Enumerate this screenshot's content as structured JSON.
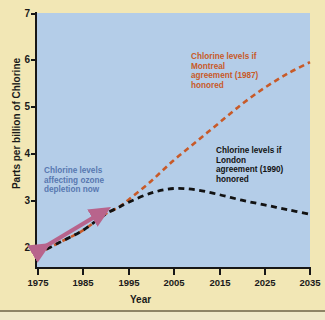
{
  "figure": {
    "background_color": "#f2e7b5",
    "plot_background_color": "#b4cde8"
  },
  "chart_data": {
    "type": "line",
    "title": "",
    "xlabel": "Year",
    "ylabel": "Parts per billion of Chlorine",
    "xlim": [
      1975,
      2035
    ],
    "ylim": [
      1.7,
      7
    ],
    "grid": false,
    "legend_position": "inline-annotations",
    "x_ticks": [
      "1975",
      "1985",
      "1995",
      "2005",
      "2015",
      "2025",
      "2035"
    ],
    "x_tick_values": [
      1975,
      1985,
      1995,
      2005,
      2015,
      2025,
      2035
    ],
    "y_ticks": [
      "2",
      "3",
      "4",
      "5",
      "6",
      "7"
    ],
    "y_tick_values": [
      2,
      3,
      4,
      5,
      6,
      7
    ],
    "series": [
      {
        "name": "Chlorine levels if Montreal agreement (1987) honored",
        "color": "#c85a28",
        "style": "dashed",
        "x": [
          1975,
          1980,
          1985,
          1990,
          1993,
          1995,
          2000,
          2005,
          2010,
          2015,
          2020,
          2025,
          2030,
          2035
        ],
        "values": [
          1.85,
          2.1,
          2.35,
          2.7,
          2.85,
          3.0,
          3.4,
          3.85,
          4.25,
          4.65,
          5.05,
          5.4,
          5.7,
          5.95
        ]
      },
      {
        "name": "Chlorine levels if London agreement (1990) honored",
        "color": "#121212",
        "style": "dashed",
        "x": [
          1975,
          1980,
          1985,
          1990,
          1993,
          1995,
          2000,
          2005,
          2010,
          2015,
          2020,
          2025,
          2030,
          2035
        ],
        "values": [
          1.85,
          2.1,
          2.35,
          2.7,
          2.85,
          2.95,
          3.15,
          3.25,
          3.22,
          3.12,
          3.0,
          2.9,
          2.8,
          2.7
        ]
      }
    ],
    "annotations": [
      {
        "id": "now",
        "text": "Chlorine levels affecting ozone depletion now",
        "color": "#5878b0",
        "marker": "double-headed-arrow",
        "marker_color": "#b8648c",
        "span_years": [
          1975,
          1992
        ]
      },
      {
        "id": "montreal",
        "text": "Chlorine levels if Montreal agreement (1987) honored",
        "color": "#c85a28"
      },
      {
        "id": "london",
        "text": "Chlorine levels if London agreement (1990) honored",
        "color": "#121212"
      }
    ]
  },
  "annotations_text": {
    "now_line1": "Chlorine levels",
    "now_line2": "affecting ozone",
    "now_line3": "depletion now",
    "montreal_line1": "Chlorine levels if",
    "montreal_line2": "Montreal",
    "montreal_line3": "agreement (1987)",
    "montreal_line4": "honored",
    "london_line1": "Chlorine levels if",
    "london_line2": "London",
    "london_line3": "agreement (1990)",
    "london_line4": "honored"
  },
  "axis_labels": {
    "x": "Year",
    "y": "Parts per billion of Chlorine"
  },
  "ticks": {
    "y": [
      "7",
      "6",
      "5",
      "4",
      "3",
      "2"
    ],
    "x": [
      "1975",
      "1985",
      "1995",
      "2005",
      "2015",
      "2025",
      "2035"
    ]
  }
}
